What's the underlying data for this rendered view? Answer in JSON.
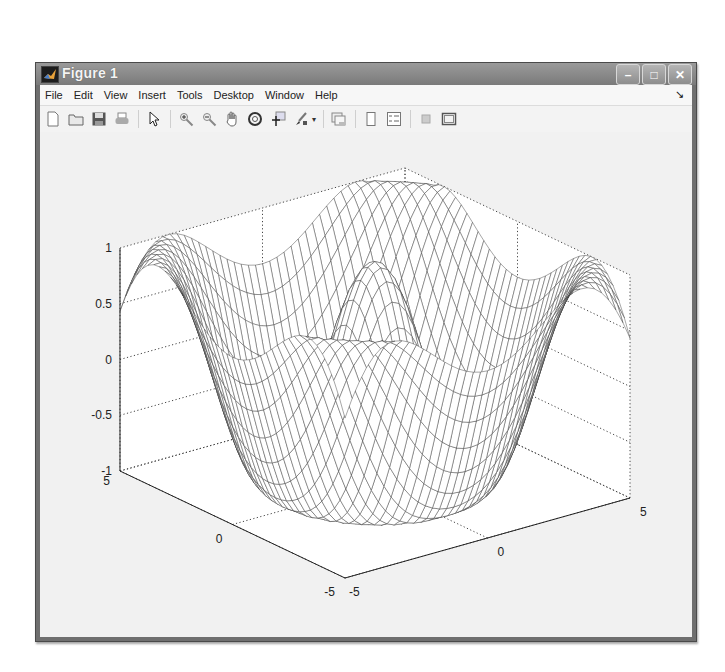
{
  "window": {
    "title": "Figure 1",
    "controls": {
      "minimize": "–",
      "maximize": "□",
      "close": "✕"
    }
  },
  "menubar": {
    "items": [
      "File",
      "Edit",
      "View",
      "Insert",
      "Tools",
      "Desktop",
      "Window",
      "Help"
    ],
    "dock_icon": "↘"
  },
  "toolbar": {
    "groups": [
      [
        "new-figure-icon",
        "open-file-icon",
        "save-icon",
        "print-icon"
      ],
      [
        "pointer-icon"
      ],
      [
        "zoom-in-icon",
        "zoom-out-icon",
        "pan-hand-icon",
        "rotate-3d-icon",
        "data-cursor-icon",
        "brush-icon"
      ],
      [
        "link-plot-icon"
      ],
      [
        "colorbar-icon",
        "legend-icon"
      ],
      [
        "hide-plot-tools-icon",
        "show-plot-tools-icon"
      ]
    ]
  },
  "chart_data": {
    "type": "surface-mesh",
    "title": "",
    "function": "z = sin(sqrt(x^2+y^2) + something) style radial ripple; depicted as concentric cosine rings",
    "x_range": [
      -5,
      5
    ],
    "y_range": [
      -5,
      5
    ],
    "z_range": [
      -1,
      1
    ],
    "x_ticks": [
      -5,
      0,
      5
    ],
    "y_ticks": [
      -5,
      0,
      5
    ],
    "z_ticks": [
      -1,
      -0.5,
      0,
      0.5,
      1
    ],
    "z_tick_labels": [
      "-1",
      "-0.5",
      "0",
      "0.5",
      "1"
    ],
    "x_tick_labels": [
      "-5",
      "0",
      "5"
    ],
    "y_tick_labels": [
      "5",
      "0",
      "-5"
    ],
    "grid": true,
    "mesh_color": "#222222",
    "view": "default 3D (az -37.5, el 30)"
  },
  "colors": {
    "titlebar": "#848484",
    "plot_background": "#ffffff",
    "figure_background": "#f1f1f1"
  }
}
